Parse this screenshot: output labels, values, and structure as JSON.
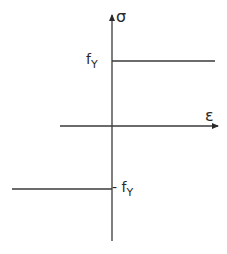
{
  "diagram": {
    "type": "stress-strain (rigid-perfectly-plastic)",
    "axes": {
      "vertical": {
        "label": "σ"
      },
      "horizontal": {
        "label": "ε"
      }
    },
    "yield_levels": {
      "upper": {
        "label": "f",
        "subscript": "Y"
      },
      "lower": {
        "label": "- f",
        "subscript": "Y"
      }
    },
    "colors": {
      "line": "#3a3a3a",
      "background": "#ffffff"
    }
  }
}
